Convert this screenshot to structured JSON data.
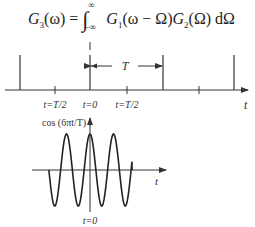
{
  "formula": {
    "lhs": "G",
    "lhs_sub": "3",
    "lhs_arg": "(ω) =",
    "int_upper": "∞",
    "int_lower": "−∞",
    "integrand_1": "G",
    "integrand_1_sub": "1",
    "integrand_1_arg": "(ω − Ω)",
    "integrand_2": "G",
    "integrand_2_sub": "2",
    "integrand_2_arg": "(Ω) dΩ"
  },
  "impulse_train": {
    "period_label": "T",
    "axis_label": "t",
    "tick_labels": [
      "t=T/2",
      "t=0",
      "t=T/2"
    ]
  },
  "cosine_plot": {
    "function_label": "cos (6πt/T)",
    "axis_label": "t",
    "origin_label": "t=0"
  },
  "colors": {
    "line": "#333333",
    "background": "#ffffff"
  }
}
